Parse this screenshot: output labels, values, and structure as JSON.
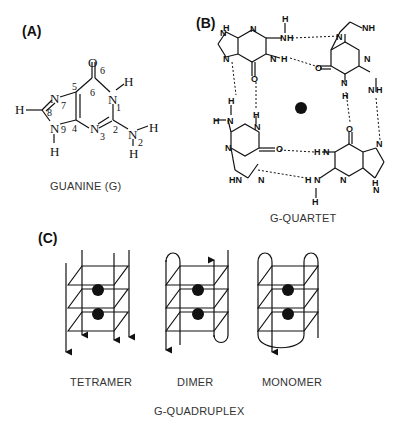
{
  "panels": {
    "a": {
      "label": "(A)",
      "caption": "GUANINE (G)",
      "atoms": {
        "o6": "O",
        "o6_num": "6",
        "n1": "N",
        "n1_num": "1",
        "h_n1": "H",
        "c6_num": "6",
        "c5_num": "5",
        "c4_num": "4",
        "c2_num": "2",
        "n3": "N",
        "n3_num": "3",
        "n7": "N",
        "n7_num": "7",
        "c8_num": "8",
        "h_c8": "H",
        "n9": "N",
        "n9_num": "9",
        "h_n9": "H",
        "n2": "N",
        "n2_num": "2",
        "h_n2a": "H",
        "h_n2b": "H"
      }
    },
    "b": {
      "label": "(B)",
      "caption": "G-QUARTET",
      "atoms": {
        "N": "N",
        "H": "H",
        "O": "O",
        "NH": "NH",
        "HN": "HN"
      }
    },
    "c": {
      "label": "(C)",
      "caption": "G-QUADRUPLEX",
      "structures": [
        {
          "name": "TETRAMER"
        },
        {
          "name": "DIMER"
        },
        {
          "name": "MONOMER"
        }
      ]
    }
  },
  "colors": {
    "ink": "#111111",
    "caption": "#333333",
    "background": "#ffffff"
  }
}
